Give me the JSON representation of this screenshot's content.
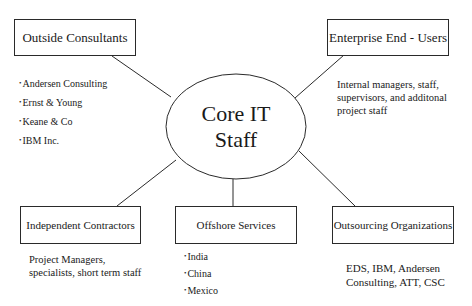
{
  "center": {
    "line1": "Core IT",
    "line2": "Staff"
  },
  "nodes": {
    "outside_consultants": {
      "label": "Outside Consultants",
      "items": [
        "Andersen Consulting",
        "Ernst & Young",
        "Keane & Co",
        "IBM Inc."
      ]
    },
    "enterprise_end_users": {
      "label": "Enterprise End - Users",
      "description": [
        "Internal managers, staff,",
        "supervisors, and additonal",
        "project staff"
      ]
    },
    "independent_contractors": {
      "label": "Independent Contractors",
      "description": [
        "Project Managers,",
        "specialists, short term staff"
      ]
    },
    "offshore_services": {
      "label": "Offshore Services",
      "items": [
        "India",
        "China",
        "Mexico"
      ]
    },
    "outsourcing_organizations": {
      "label": "Outsourcing Organizations",
      "description": [
        "EDS, IBM, Andersen",
        "Consulting, ATT, CSC"
      ]
    }
  },
  "colors": {
    "stroke": "#2a2a2a",
    "background": "#ffffff",
    "text": "#1a1a1a"
  }
}
